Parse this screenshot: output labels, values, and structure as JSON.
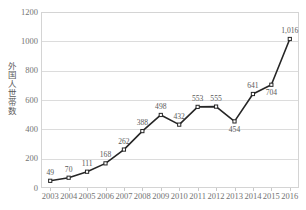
{
  "chart_data": {
    "type": "line",
    "title": "",
    "xlabel": "",
    "ylabel": "外国人世帯数",
    "categories": [
      "2003",
      "2004",
      "2005",
      "2006",
      "2007",
      "2008",
      "2009",
      "2010",
      "2011",
      "2012",
      "2013",
      "2014",
      "2015",
      "2016"
    ],
    "values": [
      49,
      70,
      111,
      168,
      262,
      388,
      498,
      432,
      553,
      555,
      454,
      641,
      704,
      1016
    ],
    "point_labels": [
      "49",
      "70",
      "111",
      "168",
      "262",
      "388",
      "498",
      "432",
      "553",
      "555",
      "454",
      "641",
      "704",
      "1,016"
    ],
    "label_positions": [
      "above",
      "above",
      "above",
      "above",
      "above",
      "above",
      "above",
      "above",
      "above",
      "above",
      "below",
      "above",
      "below",
      "above"
    ],
    "ylim": [
      0,
      1200
    ],
    "yticks": [
      0,
      200,
      400,
      600,
      800,
      1000,
      1200
    ],
    "ytick_labels": [
      "0",
      "200",
      "400",
      "600",
      "800",
      "1000",
      "1200"
    ],
    "grid": "horizontal",
    "legend": "none",
    "series_color": "#262626",
    "marker": "open-square",
    "marker_fill": "#ffffff",
    "grid_color": "#dcdcdc",
    "axis_color": "#d4d4d4",
    "text_color": "#737373"
  }
}
